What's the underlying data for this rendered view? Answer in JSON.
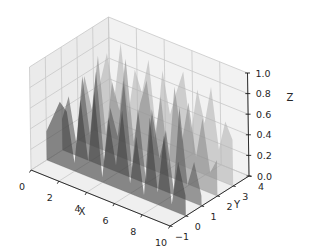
{
  "chart_data": {
    "type": "area",
    "subtype": "3d-polygons",
    "title": "",
    "xlabel": "X",
    "ylabel": "Y",
    "zlabel": "Z",
    "xlim": [
      0,
      10
    ],
    "ylim": [
      -1,
      4
    ],
    "zlim": [
      0,
      1
    ],
    "x_ticks": [
      "0",
      "2",
      "4",
      "6",
      "8",
      "10"
    ],
    "y_ticks": [
      "-1",
      "0",
      "1",
      "2",
      "3",
      "4"
    ],
    "z_ticks": [
      "0.0",
      "0.2",
      "0.4",
      "0.6",
      "0.8",
      "1.0"
    ],
    "grid": true,
    "legend": null,
    "x": [
      0,
      0.5,
      1,
      1.5,
      2,
      2.5,
      3,
      3.5,
      4,
      4.5,
      5,
      5.5,
      6,
      6.5,
      7,
      7.5,
      8,
      8.5,
      9,
      9.5,
      10
    ],
    "series": [
      {
        "name": "y=0",
        "y": 0,
        "color": "#3f3f3f",
        "alpha": 0.6,
        "values": [
          0.28,
          0.45,
          0.62,
          0.55,
          0.08,
          0.72,
          0.15,
          0.85,
          0.05,
          0.66,
          0.22,
          0.78,
          0.1,
          0.58,
          0.04,
          0.82,
          0.12,
          0.7,
          0.06,
          0.5,
          0.2
        ]
      },
      {
        "name": "y=1",
        "y": 1,
        "color": "#5a5a5a",
        "alpha": 0.6,
        "values": [
          0.3,
          0.55,
          0.12,
          0.8,
          0.25,
          0.9,
          0.05,
          0.6,
          0.35,
          0.92,
          0.1,
          0.7,
          0.02,
          0.75,
          0.3,
          0.6,
          0.05,
          0.88,
          0.15,
          0.4,
          0.1
        ]
      },
      {
        "name": "y=2",
        "y": 2,
        "color": "#8c8c8c",
        "alpha": 0.6,
        "values": [
          0.2,
          0.65,
          0.35,
          0.9,
          0.15,
          0.7,
          0.45,
          0.98,
          0.2,
          0.6,
          0.85,
          0.3,
          0.75,
          0.1,
          0.9,
          0.4,
          0.8,
          0.3,
          0.7,
          0.2,
          0.35
        ]
      },
      {
        "name": "y=3",
        "y": 3,
        "color": "#b4b4b4",
        "alpha": 0.6,
        "values": [
          0.25,
          0.5,
          0.8,
          0.4,
          0.95,
          0.3,
          0.75,
          0.55,
          0.9,
          0.2,
          0.85,
          0.45,
          0.7,
          0.92,
          0.35,
          0.8,
          0.5,
          0.88,
          0.3,
          0.6,
          0.45
        ]
      }
    ]
  },
  "axes": {
    "x_label": "X",
    "y_label": "Y",
    "z_label": "Z"
  }
}
